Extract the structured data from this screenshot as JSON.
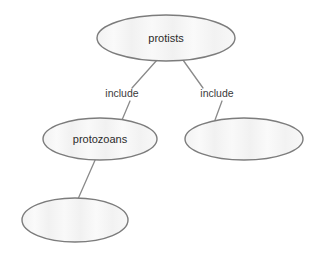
{
  "diagram": {
    "type": "concept-map",
    "background_color": "#ffffff",
    "node_fill_color": "#f4f4f4",
    "node_border_color": "#7c7c7c",
    "connector_color": "#8a8a8a",
    "text_color": "#2b2b2b",
    "nodes": [
      {
        "id": "protists",
        "label": "protists",
        "cx": 166,
        "cy": 38,
        "rx": 69,
        "ry": 23
      },
      {
        "id": "protozoans",
        "label": "protozoans",
        "cx": 100,
        "cy": 139,
        "rx": 57,
        "ry": 21
      },
      {
        "id": "blank-right",
        "label": "",
        "cx": 244,
        "cy": 139,
        "rx": 59,
        "ry": 21
      },
      {
        "id": "blank-bottom",
        "label": "",
        "cx": 75,
        "cy": 220,
        "rx": 53,
        "ry": 22
      }
    ],
    "edges": [
      {
        "id": "protists-protozoans",
        "from": "protists",
        "to": "protozoans",
        "label": "include",
        "label_x": 122,
        "label_y": 94,
        "x1": 157,
        "y1": 60,
        "x2": 132,
        "y2": 88,
        "x3": 130,
        "y3": 101,
        "x4": 122,
        "y4": 120
      },
      {
        "id": "protists-blank-right",
        "from": "protists",
        "to": "blank-right",
        "label": "include",
        "label_x": 217,
        "label_y": 94,
        "x1": 183,
        "y1": 60,
        "x2": 203,
        "y2": 88,
        "x3": 222,
        "y3": 101,
        "x4": 215,
        "y4": 120
      },
      {
        "id": "protozoans-blank-bottom",
        "from": "protozoans",
        "to": "blank-bottom",
        "label": "",
        "x1": 96,
        "y1": 158,
        "x2": 78,
        "y2": 199
      }
    ]
  }
}
